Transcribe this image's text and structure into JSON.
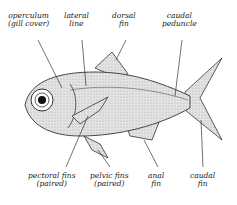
{
  "diagram": {
    "labels": {
      "operculum": {
        "line1": "operculum",
        "line2": "(gill cover)"
      },
      "lateral_line": {
        "line1": "lateral",
        "line2": "line"
      },
      "dorsal_fin": {
        "line1": "dorsal",
        "line2": "fin"
      },
      "caudal_peduncle": {
        "line1": "caudal",
        "line2": "peduncle"
      },
      "pectoral_fins": {
        "line1": "pectoral fins",
        "line2": "(paired)"
      },
      "pelvic_fins": {
        "line1": "pelvic fins",
        "line2": "(paired)"
      },
      "anal_fin": {
        "line1": "anal",
        "line2": "fin"
      },
      "caudal_fin": {
        "line1": "caudal",
        "line2": "fin"
      }
    },
    "colors": {
      "ink": "#222222",
      "shade": "#cfcfcf",
      "background": "#ffffff"
    }
  }
}
